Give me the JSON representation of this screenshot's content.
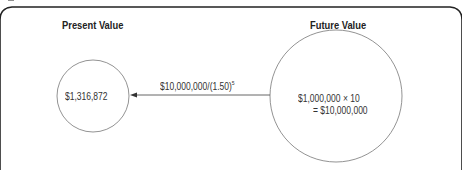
{
  "diagram": {
    "left_title": "Present Value",
    "right_title": "Future Value",
    "present_value": "$1,316,872",
    "arrow_label_base": "$10,000,000/(1.50)",
    "arrow_label_exponent": "5",
    "future_value_line1": "$1,000,000 × 10",
    "future_value_line2": "= $10,000,000",
    "colors": {
      "frame": "#222222",
      "circle": "#777777",
      "arrow": "#555555",
      "text": "#222222"
    }
  }
}
